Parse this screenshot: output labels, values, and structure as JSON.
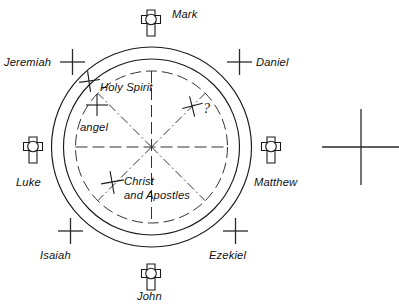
{
  "figure": {
    "type": "schematic-diagram",
    "background_color": "#ffffff",
    "ink_color": "#1a1a1a"
  },
  "geometry": {
    "center": {
      "x": 151.5,
      "y": 147
    },
    "outer_circle_radius": 100,
    "middle_circle_radius": 88,
    "inner_dashed_circle_radius": 76,
    "standalone_cross": {
      "x": 361,
      "y": 147,
      "half_width": 39,
      "half_height": 38
    }
  },
  "evangelists": [
    {
      "name": "mark-symbol",
      "label": "Mark",
      "position": "top",
      "icon": "ringed-cross-icon",
      "glyph_x": 151,
      "glyph_y": 20,
      "label_x": 172,
      "label_y": 18
    },
    {
      "name": "matthew-symbol",
      "label": "Matthew",
      "position": "right",
      "icon": "ringed-cross-icon",
      "glyph_x": 271,
      "glyph_y": 147,
      "label_x": 254,
      "label_y": 186
    },
    {
      "name": "john-symbol",
      "label": "John",
      "position": "bottom",
      "icon": "ringed-cross-icon",
      "glyph_x": 151,
      "glyph_y": 274,
      "label_x": 137,
      "label_y": 300
    },
    {
      "name": "luke-symbol",
      "label": "Luke",
      "position": "left",
      "icon": "ringed-cross-icon",
      "glyph_x": 33,
      "glyph_y": 147,
      "label_x": 16,
      "label_y": 186
    }
  ],
  "prophets": [
    {
      "name": "jeremiah-cross",
      "label": "Jeremiah",
      "position": "upper-left",
      "icon": "plus-cross-icon",
      "cross_x": 72,
      "cross_y": 62,
      "label_x": 4,
      "label_y": 66,
      "anchor": "start"
    },
    {
      "name": "daniel-cross",
      "label": "Daniel",
      "position": "upper-right",
      "icon": "plus-cross-icon",
      "cross_x": 239,
      "cross_y": 62,
      "label_x": 256,
      "label_y": 66,
      "anchor": "start"
    },
    {
      "name": "isaiah-cross",
      "label": "Isaiah",
      "position": "lower-left",
      "icon": "plus-cross-icon",
      "cross_x": 70,
      "cross_y": 231,
      "label_x": 40,
      "label_y": 259,
      "anchor": "start"
    },
    {
      "name": "ezekiel-cross",
      "label": "Ezekiel",
      "position": "lower-right",
      "icon": "plus-cross-icon",
      "cross_x": 235,
      "cross_y": 231,
      "label_x": 209,
      "label_y": 259,
      "anchor": "start"
    }
  ],
  "inner_annotations": [
    {
      "name": "holy-spirit-annotation",
      "label": "Holy Spirit",
      "icon": "plus-cross-icon",
      "cross_x": 89,
      "cross_y": 81,
      "label_x": 100,
      "label_y": 91,
      "line2": ""
    },
    {
      "name": "angel-annotation",
      "label": "angel",
      "icon": "plus-cross-icon",
      "cross_x": 97,
      "cross_y": 105,
      "label_x": 80,
      "label_y": 131,
      "line2": ""
    },
    {
      "name": "unknown-annotation",
      "label": "?",
      "icon": "plus-cross-icon",
      "cross_x": 192,
      "cross_y": 106,
      "label_x": 203,
      "label_y": 113,
      "line2": ""
    },
    {
      "name": "christ-apostles-annotation",
      "label": "Christ",
      "icon": "plus-cross-icon",
      "cross_x": 112,
      "cross_y": 182,
      "label_x": 124,
      "label_y": 185,
      "line2": "and Apostles"
    }
  ],
  "standalone": {
    "name": "scale-cross",
    "label": "",
    "icon": "plus-cross-icon"
  },
  "spokes": {
    "count": 8,
    "style": "dash-dot",
    "angles_deg": [
      0,
      45,
      90,
      135,
      180,
      225,
      270,
      315
    ]
  }
}
